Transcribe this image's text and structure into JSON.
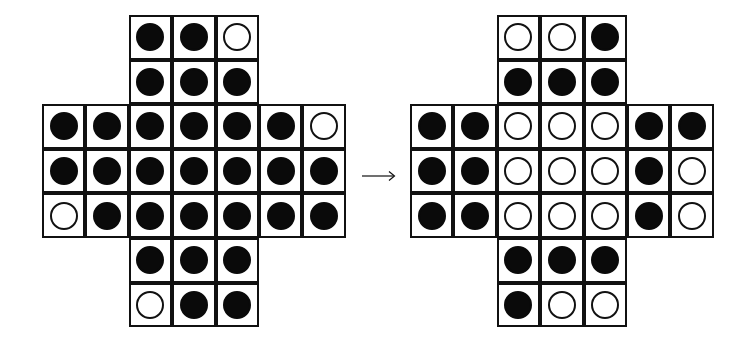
{
  "figure": {
    "grid_size": 7,
    "cell_colors": {
      "border": "#111111",
      "filled_peg": "#0a0a0a",
      "empty_hole": "#ffffff"
    },
    "legend": {
      "X": "filled peg (black disc)",
      "O": "empty hole (white circle)",
      ".": "no cell"
    },
    "arrow": {
      "glyph": "→",
      "direction": "right"
    },
    "boards": [
      {
        "id": "left",
        "label": "before",
        "rows": [
          "..XXO..",
          "..XXX..",
          "XXXXXXO",
          "XXXXXXX",
          "OXXXXXX",
          "..XXX..",
          "..OXX.."
        ]
      },
      {
        "id": "right",
        "label": "after",
        "rows": [
          "..OOX..",
          "..XXX..",
          "XXOOOXX",
          "XXOOOXO",
          "XXOOOXO",
          "..XXX..",
          "..XOO.."
        ]
      }
    ]
  }
}
